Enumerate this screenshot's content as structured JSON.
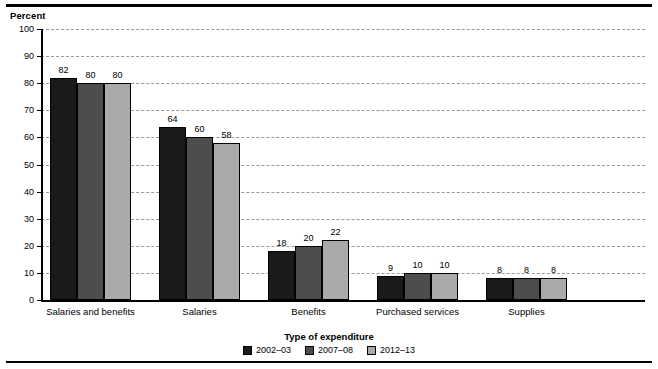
{
  "chart_data": {
    "type": "bar",
    "title": "",
    "xlabel": "Type of expenditure",
    "ylabel": "Percent",
    "ylim": [
      0,
      100
    ],
    "yticks": [
      0,
      10,
      20,
      30,
      40,
      50,
      60,
      70,
      80,
      90,
      100
    ],
    "ytick_labels": [
      "0",
      "10",
      "20",
      "30",
      "40",
      "50",
      "60",
      "70",
      "80",
      "90",
      "100"
    ],
    "grid": true,
    "legend_position": "bottom-center",
    "categories": [
      "Salaries and benefits",
      "Salaries",
      "Benefits",
      "Purchased services",
      "Supplies"
    ],
    "series": [
      {
        "name": "2002–03",
        "color": "#1a1a1a",
        "values": [
          82,
          64,
          18,
          9,
          8
        ],
        "labels": [
          "82",
          "64",
          "18",
          "9",
          "8"
        ]
      },
      {
        "name": "2007–08",
        "color": "#4d4d4d",
        "values": [
          80,
          60,
          20,
          10,
          8
        ],
        "labels": [
          "80",
          "60",
          "20",
          "10",
          "8"
        ]
      },
      {
        "name": "2012–13",
        "color": "#aaaaaa",
        "values": [
          80,
          58,
          22,
          10,
          8
        ],
        "labels": [
          "80",
          "58",
          "22",
          "10",
          "8"
        ]
      }
    ]
  }
}
